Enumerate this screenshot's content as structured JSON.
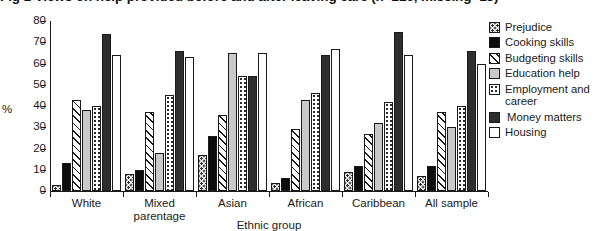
{
  "figure": {
    "title_clipped": "Fig 1  Views on help provided before and after leaving care (n=216, missing=13)",
    "ylabel": "%",
    "xlabel": "Ethnic group"
  },
  "yaxis": {
    "ticks": [
      "80",
      "70",
      "60",
      "50",
      "40",
      "30",
      "20",
      "10",
      "0"
    ],
    "min": 0,
    "max": 80
  },
  "legend": [
    {
      "label": "Prejudice",
      "pattern": "dots-sparse",
      "color": "#ffffff",
      "name": "prejudice"
    },
    {
      "label": "Cooking skills",
      "pattern": "solid-black",
      "color": "#0d0d0d",
      "name": "cooking-skills"
    },
    {
      "label": "Budgeting skills",
      "pattern": "diagonal-hatch",
      "color": "#ffffff",
      "name": "budgeting-skills"
    },
    {
      "label": "Education help",
      "pattern": "solid-light-gray",
      "color": "#c9c9c9",
      "name": "education-help"
    },
    {
      "label": "Employment and career",
      "pattern": "dots-fine",
      "color": "#ffffff",
      "name": "employment-and-career"
    },
    {
      "label": "Money matters",
      "pattern": "solid-dark-gray",
      "color": "#2e2e2e",
      "name": "money-matters"
    },
    {
      "label": "Housing",
      "pattern": "open-white",
      "color": "#ffffff",
      "name": "housing"
    }
  ],
  "chart_data": {
    "type": "bar",
    "title": "Fig 1  Views on help provided before and after leaving care (n=216, missing=13)",
    "xlabel": "Ethnic group",
    "ylabel": "%",
    "ylim": [
      0,
      80
    ],
    "yticks": [
      0,
      10,
      20,
      30,
      40,
      50,
      60,
      70,
      80
    ],
    "grid": false,
    "legend_position": "right",
    "categories": [
      "White",
      "Mixed parentage",
      "Asian",
      "African",
      "Caribbean",
      "All sample"
    ],
    "series": [
      {
        "name": "Prejudice",
        "values": [
          3,
          8,
          17,
          4,
          9,
          7
        ]
      },
      {
        "name": "Cooking skills",
        "values": [
          13,
          10,
          26,
          6,
          12,
          12
        ]
      },
      {
        "name": "Budgeting skills",
        "values": [
          43,
          37,
          36,
          29,
          27,
          37
        ]
      },
      {
        "name": "Education help",
        "values": [
          38,
          18,
          65,
          43,
          32,
          30
        ]
      },
      {
        "name": "Employment and career",
        "values": [
          40,
          45,
          54,
          46,
          42,
          40
        ]
      },
      {
        "name": "Money matters",
        "values": [
          74,
          66,
          54,
          64,
          75,
          66
        ]
      },
      {
        "name": "Housing",
        "values": [
          64,
          63,
          65,
          67,
          64,
          60
        ]
      }
    ]
  }
}
